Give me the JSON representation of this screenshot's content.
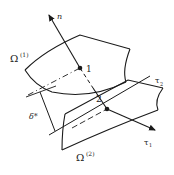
{
  "diagram": {
    "labels": {
      "normal": "n",
      "surface_upper": "Ω",
      "surface_upper_sup": "(1)",
      "surface_lower": "Ω",
      "surface_lower_sup": "(2)",
      "point1": "1",
      "point2": "2",
      "tangent1": "τ",
      "tangent1_sub": "1",
      "tangent2": "τ",
      "tangent2_sub": "2",
      "gap": "δ*"
    },
    "colors": {
      "stroke": "#1a1a1a",
      "background": "#ffffff"
    }
  }
}
